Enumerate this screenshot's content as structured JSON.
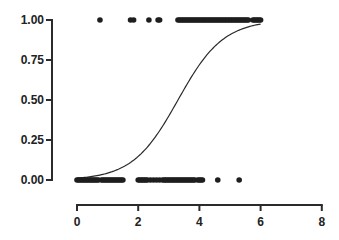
{
  "chart_data": {
    "type": "scatter",
    "title": "",
    "xlabel": "",
    "ylabel": "",
    "xlim": [
      0,
      8
    ],
    "ylim": [
      0,
      1
    ],
    "x_ticks": [
      0,
      2,
      4,
      6,
      8
    ],
    "x_tick_labels": [
      "0",
      "2",
      "4",
      "6",
      "8"
    ],
    "y_ticks": [
      0,
      0.25,
      0.5,
      0.75,
      1.0
    ],
    "y_tick_labels": [
      "0.00",
      "0.25",
      "0.50",
      "0.75",
      "1.00"
    ],
    "grid": false,
    "legend": null,
    "series": [
      {
        "name": "observations_y1",
        "type": "scatter",
        "y": 1,
        "x": [
          0.75,
          1.75,
          1.85,
          2.35,
          2.65,
          2.7,
          3.3,
          3.35,
          3.4,
          3.45,
          3.5,
          3.55,
          3.6,
          3.65,
          3.7,
          3.75,
          3.8,
          3.85,
          3.9,
          3.95,
          4.0,
          4.05,
          4.1,
          4.15,
          4.2,
          4.25,
          4.3,
          4.35,
          4.4,
          4.45,
          4.5,
          4.55,
          4.6,
          4.65,
          4.7,
          4.75,
          4.8,
          4.85,
          4.9,
          4.95,
          5.0,
          5.05,
          5.1,
          5.15,
          5.2,
          5.25,
          5.3,
          5.35,
          5.4,
          5.45,
          5.5,
          5.55,
          5.6,
          5.75,
          5.8,
          5.85,
          5.9,
          5.95,
          6.0
        ]
      },
      {
        "name": "observations_y0",
        "type": "scatter",
        "y": 0,
        "x": [
          0.0,
          0.05,
          0.1,
          0.15,
          0.2,
          0.25,
          0.3,
          0.35,
          0.4,
          0.45,
          0.5,
          0.55,
          0.6,
          0.65,
          0.7,
          0.8,
          0.85,
          0.9,
          0.95,
          1.0,
          1.05,
          1.1,
          1.15,
          1.2,
          1.25,
          1.3,
          1.35,
          1.4,
          1.45,
          1.5,
          2.0,
          2.05,
          2.1,
          2.15,
          2.2,
          2.25,
          2.3,
          2.4,
          2.5,
          2.6,
          2.7,
          2.8,
          2.85,
          2.9,
          2.95,
          3.0,
          3.05,
          3.1,
          3.15,
          3.2,
          3.25,
          3.3,
          3.35,
          3.4,
          3.45,
          3.5,
          3.55,
          3.6,
          3.65,
          3.7,
          3.75,
          3.8,
          3.85,
          3.95,
          4.0,
          4.05,
          4.1,
          4.6,
          5.3
        ]
      },
      {
        "name": "logistic_fit",
        "type": "line",
        "function": "1/(1+exp(-k*(x-x0)))",
        "k": 1.35,
        "x0": 3.3,
        "x_range": [
          0,
          6
        ]
      }
    ]
  },
  "style": {
    "point_color": "#1e1e1e",
    "curve_color": "#2a2a2a",
    "axis_color": "#2b2b2b"
  }
}
